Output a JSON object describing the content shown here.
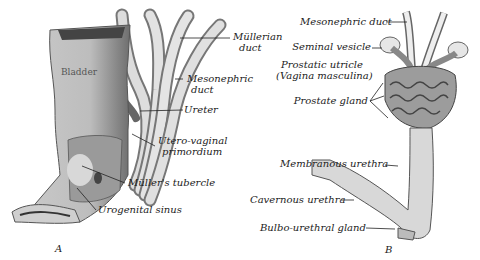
{
  "figure_a": {
    "panel_label": "A",
    "organ_label": "Bladder",
    "labels": [
      {
        "id": "mullerian-duct",
        "text": "Müllerian",
        "text2": "duct"
      },
      {
        "id": "mesonephric-duct",
        "text": "Mesonephric",
        "text2": "duct"
      },
      {
        "id": "ureter",
        "text": "Ureter"
      },
      {
        "id": "utero-vaginal-primordium",
        "text": "Utero-vaginal",
        "text2": "primordium"
      },
      {
        "id": "mullers-tubercle",
        "text": "Müller's tubercle"
      },
      {
        "id": "urogenital-sinus",
        "text": "Urogenital sinus"
      }
    ]
  },
  "figure_b": {
    "panel_label": "B",
    "labels": [
      {
        "id": "mesonephric-duct",
        "text": "Mesonephric duct"
      },
      {
        "id": "seminal-vesicle",
        "text": "Seminal vesicle"
      },
      {
        "id": "prostatic-utricle",
        "text": "Prostatic utricle",
        "text2": "(Vagina masculina)"
      },
      {
        "id": "prostate-gland",
        "text": "Prostate gland"
      },
      {
        "id": "membranous-urethra",
        "text": "Membranous urethra"
      },
      {
        "id": "cavernous-urethra",
        "text": "Cavernous urethra"
      },
      {
        "id": "bulbo-urethral-gland",
        "text": "Bulbo-urethral gland"
      }
    ]
  }
}
